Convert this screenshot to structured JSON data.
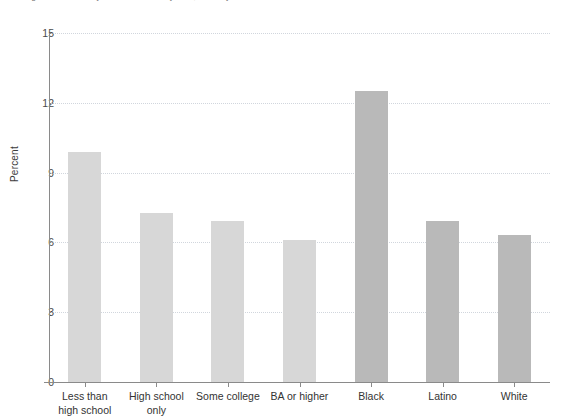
{
  "figure": {
    "caption": "Figure 4.1   Disability not an obstacle by race, ethnicity and education in market work"
  },
  "chart_data": {
    "type": "bar",
    "title": "",
    "xlabel": "",
    "ylabel": "Percent",
    "ylim": [
      0,
      15
    ],
    "yticks": [
      0,
      3,
      6,
      9,
      12,
      15
    ],
    "ytick_labels": [
      "0",
      "3",
      "6",
      "9",
      "12",
      "15"
    ],
    "grid": true,
    "legend": "none",
    "categories": [
      "Less than\nhigh school",
      "High school\nonly",
      "Some college",
      "BA or higher",
      "Black",
      "Latino",
      "White"
    ],
    "values": [
      9.9,
      7.25,
      6.9,
      6.1,
      12.5,
      6.9,
      6.3
    ],
    "groups": [
      "education",
      "education",
      "education",
      "education",
      "race",
      "race",
      "race"
    ],
    "colors": {
      "education_bar": "#d7d7d7",
      "race_bar": "#b9b9b9",
      "gridline": "#c9cfd8",
      "axis": "#8a8a8a",
      "text": "#333333"
    }
  }
}
